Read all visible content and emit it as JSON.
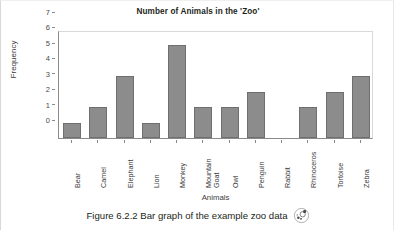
{
  "chart_data": {
    "type": "bar",
    "title": "Number of Animals in the 'Zoo'",
    "xlabel": "Animals",
    "ylabel": "Frequency",
    "categories": [
      "Bear",
      "Camel",
      "Elephant",
      "Lion",
      "Monkey",
      "Mountain\nGoat",
      "Owl",
      "Penguin",
      "Rabbit",
      "Rhinoceros",
      "Tortoise",
      "Zebra"
    ],
    "values": [
      1,
      2,
      4,
      1,
      6,
      2,
      2,
      3,
      0,
      2,
      3,
      4
    ],
    "ylim": [
      0,
      7
    ],
    "yticks": [
      0,
      1,
      2,
      3,
      4,
      5,
      6,
      7
    ],
    "ytick_labels": [
      "0",
      "1",
      "2",
      "3",
      "4",
      "5",
      "6",
      "7"
    ],
    "grid": false,
    "legend": "none",
    "bar_color": "#8c8c8c",
    "bar_edge_color": "#6f6f6f"
  },
  "caption": {
    "text": "Figure 6.2.2 Bar graph of the example zoo data",
    "icon": "dice-disc-icon"
  }
}
